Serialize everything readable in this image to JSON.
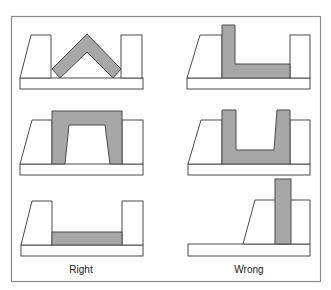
{
  "figure": {
    "labels": {
      "right": "Right",
      "wrong": "Wrong"
    },
    "colors": {
      "fill": "#a7a7a7",
      "stroke": "#4a4a4a",
      "frame": "#8a8a8a",
      "background": "#ffffff"
    },
    "panels": [
      {
        "column": "Right",
        "row": 1,
        "description": "inverted V part spanning gap between blocks"
      },
      {
        "column": "Wrong",
        "row": 1,
        "description": "L-shaped part resting in gap"
      },
      {
        "column": "Right",
        "row": 2,
        "description": "arch part spanning gap and resting on blocks"
      },
      {
        "column": "Wrong",
        "row": 2,
        "description": "U-shaped part resting in gap"
      },
      {
        "column": "Right",
        "row": 3,
        "description": "flat strip part filling gap"
      },
      {
        "column": "Wrong",
        "row": 3,
        "description": "tall vertical bar standing on block"
      }
    ]
  }
}
